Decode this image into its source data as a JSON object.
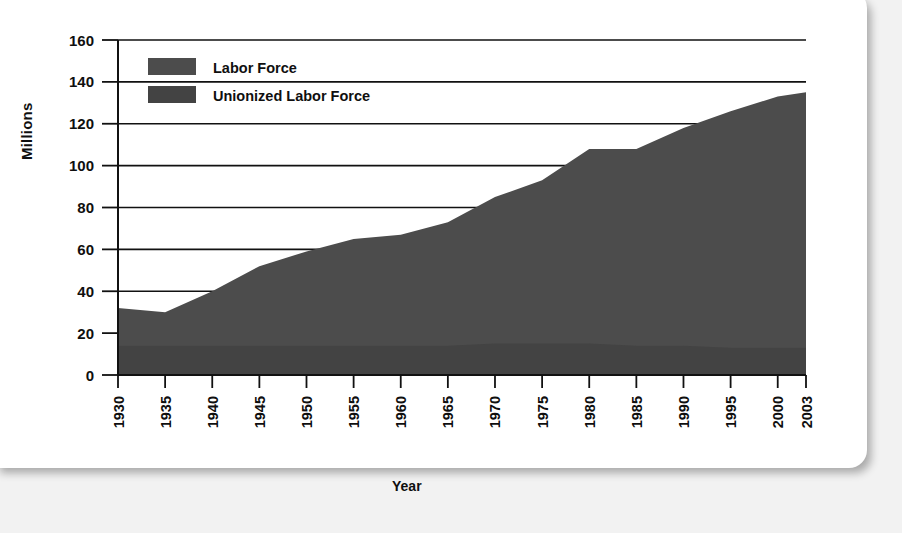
{
  "chart_data": {
    "type": "area",
    "title": "",
    "subtitle": "",
    "xlabel": "Year",
    "ylabel": "Millions",
    "xlim": [
      1930,
      2003
    ],
    "ylim": [
      0,
      160
    ],
    "grid": true,
    "legend_position": "top-left",
    "categories": [
      1930,
      1935,
      1940,
      1945,
      1950,
      1955,
      1960,
      1965,
      1970,
      1975,
      1980,
      1985,
      1990,
      1995,
      2000,
      2003
    ],
    "xtick_labels": [
      "1930",
      "1935",
      "1940",
      "1945",
      "1950",
      "1955",
      "1960",
      "1965",
      "1970",
      "1975",
      "1980",
      "1985",
      "1990",
      "1995",
      "2000",
      "2003"
    ],
    "ytick_labels": [
      "0",
      "20",
      "40",
      "60",
      "80",
      "100",
      "120",
      "140",
      "160"
    ],
    "ytick_values": [
      0,
      20,
      40,
      60,
      80,
      100,
      120,
      140,
      160
    ],
    "series": [
      {
        "name": "Labor Force",
        "color": "#4c4c4c",
        "values": [
          32,
          30,
          40,
          52,
          59,
          65,
          67,
          73,
          85,
          93,
          108,
          108,
          118,
          126,
          133,
          135
        ]
      },
      {
        "name": "Unionized Labor Force",
        "color": "#434343",
        "values": [
          14,
          14,
          14,
          14,
          14,
          14,
          14,
          14,
          15,
          15,
          15,
          14,
          14,
          13,
          13,
          13
        ]
      }
    ],
    "legend": [
      {
        "label": "Labor Force",
        "color": "#4c4c4c",
        "swatch": "legend-swatch-labor-force"
      },
      {
        "label": "Unionized Labor Force",
        "color": "#434343",
        "swatch": "legend-swatch-unionized-labor-force"
      }
    ]
  },
  "axes": {
    "y_title": "Millions",
    "x_title": "Year"
  },
  "colors": {
    "page_background": "#f2f2f2",
    "card_background": "#ffffff",
    "axis": "#111111",
    "grid": "#111111",
    "area_labor_force": "#4c4c4c",
    "area_unionized": "#434343",
    "text": "#0f0f0f"
  }
}
